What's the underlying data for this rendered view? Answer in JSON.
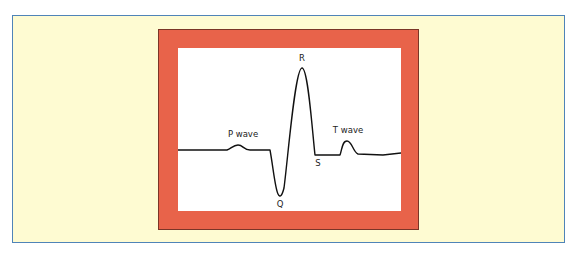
{
  "diagram": {
    "title": "",
    "labels": {
      "p_wave": "P wave",
      "q": "Q",
      "r": "R",
      "s": "S",
      "t_wave": "T wave"
    },
    "colors": {
      "background": "#fefbd2",
      "panel_border": "#4f84b8",
      "frame": "#e8634a",
      "frame_outline": "#7a3527",
      "plot_background": "#ffffff",
      "trace": "#111111"
    }
  }
}
